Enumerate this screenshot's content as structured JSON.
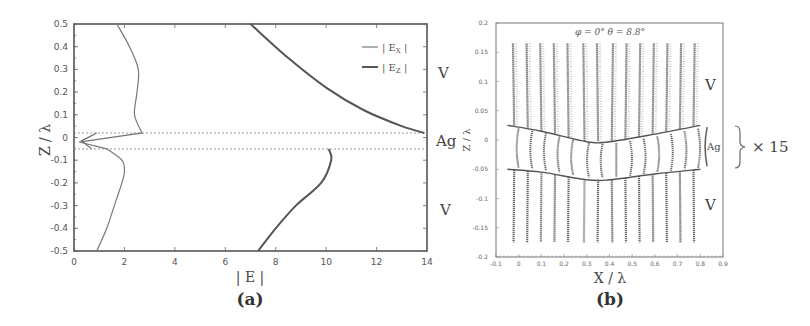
{
  "chart_data": [
    {
      "panel": "(a)",
      "type": "line",
      "title": "",
      "xlabel": "|E|",
      "ylabel": "Z / λ",
      "xlim": [
        0,
        14
      ],
      "ylim": [
        -0.5,
        0.5
      ],
      "xticks": [
        "0",
        "2",
        "4",
        "6",
        "8",
        "10",
        "12",
        "14"
      ],
      "yticks": [
        "0.5",
        "0.4",
        "0.3",
        "0.2",
        "0.1",
        "0",
        "-0.1",
        "-0.2",
        "-0.3",
        "-0.4",
        "-0.5"
      ],
      "grid": false,
      "legend": {
        "position": "upper right",
        "entries": [
          "|E_X|",
          "|E_Z|"
        ]
      },
      "interfaces_z": [
        0.02,
        -0.05
      ],
      "region_labels": [
        "V",
        "Ag",
        "V"
      ],
      "series": [
        {
          "name": "|E_X|",
          "points": [
            [
              1.7,
              0.5
            ],
            [
              2.2,
              0.4
            ],
            [
              2.55,
              0.3
            ],
            [
              2.5,
              0.2
            ],
            [
              2.4,
              0.1
            ],
            [
              2.7,
              0.02
            ],
            [
              0.2,
              -0.02
            ],
            [
              1.3,
              -0.05
            ],
            [
              1.9,
              -0.1
            ],
            [
              2.0,
              -0.15
            ],
            [
              1.9,
              -0.2
            ],
            [
              1.6,
              -0.3
            ],
            [
              1.3,
              -0.4
            ],
            [
              0.9,
              -0.5
            ]
          ]
        },
        {
          "name": "|E_Z| (upper V)",
          "points": [
            [
              7.0,
              0.5
            ],
            [
              8.5,
              0.35
            ],
            [
              10.0,
              0.22
            ],
            [
              11.5,
              0.12
            ],
            [
              13.0,
              0.05
            ],
            [
              13.9,
              0.02
            ]
          ]
        },
        {
          "name": "|E_Z| (lower V)",
          "points": [
            [
              10.1,
              -0.05
            ],
            [
              10.2,
              -0.1
            ],
            [
              9.8,
              -0.2
            ],
            [
              8.8,
              -0.3
            ],
            [
              8.0,
              -0.4
            ],
            [
              7.3,
              -0.5
            ]
          ]
        }
      ]
    },
    {
      "panel": "(b)",
      "type": "vector-field",
      "title": "φ = 0°   θ = 8.8°",
      "xlabel": "X / λ",
      "ylabel": "Z / λ",
      "xlim": [
        -0.1,
        0.9
      ],
      "ylim": [
        -0.2,
        0.2
      ],
      "xticks": [
        "-0.1",
        "0",
        "0.1",
        "0.2",
        "0.3",
        "0.4",
        "0.5",
        "0.6",
        "0.7",
        "0.8",
        "0.9"
      ],
      "yticks": [
        "0.2",
        "0.15",
        "0.1",
        "0.05",
        "0",
        "-0.05",
        "-0.1",
        "-0.15",
        "-0.2"
      ],
      "grid": false,
      "field_lines_x": [
        -0.02,
        0.04,
        0.1,
        0.16,
        0.22,
        0.29,
        0.35,
        0.41,
        0.47,
        0.53,
        0.59,
        0.65,
        0.71,
        0.77
      ],
      "upper_interface": [
        [
          -0.05,
          0.025
        ],
        [
          0.1,
          0.015
        ],
        [
          0.3,
          -0.003
        ],
        [
          0.4,
          -0.003
        ],
        [
          0.6,
          0.01
        ],
        [
          0.8,
          0.025
        ]
      ],
      "lower_interface": [
        [
          -0.05,
          -0.05
        ],
        [
          0.1,
          -0.055
        ],
        [
          0.3,
          -0.068
        ],
        [
          0.4,
          -0.068
        ],
        [
          0.6,
          -0.058
        ],
        [
          0.8,
          -0.05
        ]
      ],
      "region_labels": [
        "V",
        "Ag",
        "V"
      ],
      "annotation": "× 15"
    }
  ],
  "labels": {
    "a": {
      "panel": "(a)",
      "xlabel": "| E |",
      "ylabel": "Z / λ",
      "legend": [
        {
          "text": "| E",
          "sub": "X",
          "end": " |"
        },
        {
          "text": "| E",
          "sub": "Z",
          "end": " |"
        }
      ],
      "regions": [
        "V",
        "Ag",
        "V"
      ]
    },
    "b": {
      "panel": "(b)",
      "title": "φ = 0°   θ = 8.8°",
      "xlabel": "X / λ",
      "ylabel": "Z / λ",
      "regions": [
        "V",
        "Ag",
        "V"
      ],
      "scale": "× 15"
    }
  },
  "colors": {
    "axis": "#555555",
    "curve": "#6a6a6a",
    "curve_thick": "#555555",
    "vector": "#666666",
    "dotted": "#999999"
  }
}
